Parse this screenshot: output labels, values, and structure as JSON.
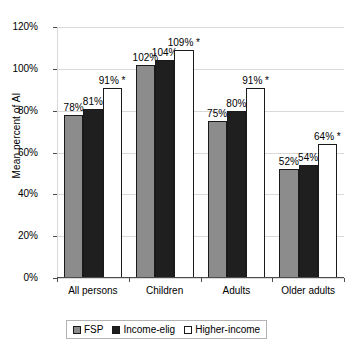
{
  "chart_data": {
    "type": "bar",
    "title": "",
    "subtitle": "",
    "xlabel": "",
    "ylabel": "Mean percent of AI",
    "ylim": [
      0,
      120
    ],
    "ytick_labels": [
      "0%",
      "20%",
      "40%",
      "60%",
      "80%",
      "100%",
      "120%"
    ],
    "ytick_values": [
      0,
      20,
      40,
      60,
      80,
      100,
      120
    ],
    "grid": true,
    "legend_position": "bottom",
    "categories": [
      "All persons",
      "Children",
      "Adults",
      "Older adults"
    ],
    "series": [
      {
        "name": "FSP",
        "color": "#8c8c8c",
        "values": [
          78,
          102,
          75,
          52
        ],
        "labels": [
          "78%",
          "102%",
          "75%",
          "52%"
        ]
      },
      {
        "name": "Income-elig",
        "color": "#1f1f1f",
        "values": [
          81,
          104,
          80,
          54
        ],
        "labels": [
          "81%",
          "104%",
          "80%",
          "54%"
        ]
      },
      {
        "name": "Higher-income",
        "color": "#ffffff",
        "values": [
          91,
          109,
          91,
          64
        ],
        "labels": [
          "91% *",
          "109% *",
          "91% *",
          "64% *"
        ]
      }
    ],
    "annotations": [
      "* denotes statistical significance"
    ]
  },
  "legend": {
    "items": [
      {
        "label": "FSP",
        "swatch": "#8c8c8c"
      },
      {
        "label": "Income-elig",
        "swatch": "#1f1f1f"
      },
      {
        "label": "Higher-income",
        "swatch": "#ffffff"
      }
    ]
  },
  "colors": {
    "gridline": "#d9d9d9",
    "axis": "#4d4d4d",
    "bar_outline": "#1a1a1a",
    "background": "#ffffff"
  }
}
